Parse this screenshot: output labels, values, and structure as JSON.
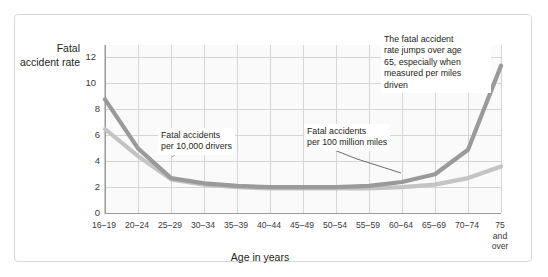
{
  "axes": {
    "y_title": "Fatal\naccident\nrate",
    "x_title": "Age in years",
    "y_ticks": [
      "0",
      "2",
      "4",
      "6",
      "8",
      "10",
      "12"
    ],
    "x_ticks": [
      "16–19",
      "20–24",
      "25–29",
      "30–34",
      "35–39",
      "40–44",
      "45–49",
      "50–54",
      "55–59",
      "60–64",
      "65–69",
      "70–74",
      "75\nand\nover"
    ]
  },
  "annotations": {
    "drivers": "Fatal accidents\nper 10,000 drivers",
    "miles": "Fatal accidents\nper 100 million miles",
    "jump": "The fatal accident\nrate jumps over age\n65, especially when\nmeasured per miles\ndriven"
  },
  "colors": {
    "series_miles": "#9a9a9a",
    "series_drivers": "#c4c4c4",
    "grid": "#d5d5d5",
    "axis": "#9b9b9b",
    "text": "#231f20",
    "frame": "#d8d8d8",
    "plot_bg": "#fafafa"
  },
  "chart_data": {
    "type": "line",
    "title": "",
    "xlabel": "Age in years",
    "ylabel": "Fatal accident rate",
    "categories": [
      "16–19",
      "20–24",
      "25–29",
      "30–34",
      "35–39",
      "40–44",
      "45–49",
      "50–54",
      "55–59",
      "60–64",
      "65–69",
      "70–74",
      "75 and over"
    ],
    "ylim": [
      0,
      13
    ],
    "xlim": [
      0,
      12
    ],
    "grid": true,
    "legend": "annotations-on-plot",
    "series": [
      {
        "name": "Fatal accidents per 100 million miles",
        "color": "#9a9a9a",
        "values": [
          8.8,
          5.0,
          2.7,
          2.3,
          2.1,
          2.0,
          2.0,
          2.0,
          2.1,
          2.4,
          3.0,
          4.9,
          11.4
        ]
      },
      {
        "name": "Fatal accidents per 10,000 drivers",
        "color": "#c4c4c4",
        "values": [
          6.5,
          4.4,
          2.6,
          2.2,
          2.0,
          1.9,
          1.9,
          1.9,
          1.9,
          2.0,
          2.2,
          2.7,
          3.6
        ]
      }
    ]
  }
}
